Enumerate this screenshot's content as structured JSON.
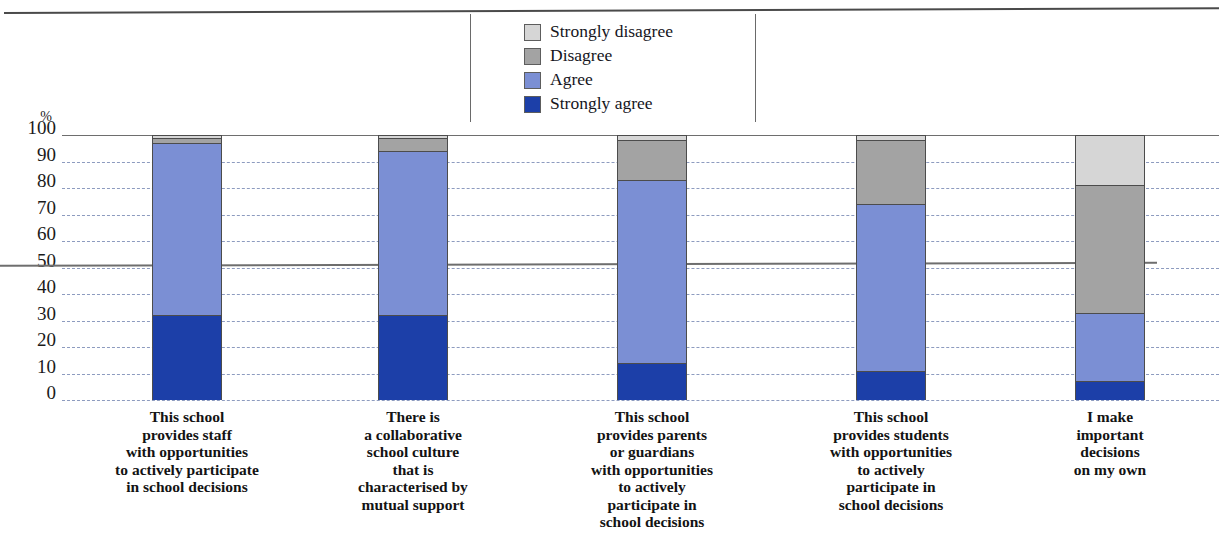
{
  "chart_data": {
    "type": "bar",
    "subtype": "stacked-column-100",
    "title": "",
    "xlabel": "",
    "ylabel": "%",
    "ylim": [
      0,
      100
    ],
    "ytick_labels": [
      "100",
      "90",
      "80",
      "70",
      "60",
      "50",
      "40",
      "30",
      "20",
      "10",
      "0"
    ],
    "ytick_values": [
      100,
      90,
      80,
      70,
      60,
      50,
      40,
      30,
      20,
      10,
      0
    ],
    "grid": true,
    "legend_position": "top-center",
    "categories": [
      "This school provides staff with opportunities to actively participate in school decisions",
      "There is a collaborative school culture that is characterised by mutual support",
      "This school provides parents or guardians with opportunities to actively participate in school decisions",
      "This school provides students with opportunities to actively participate in school decisions",
      "I make important decisions on my own"
    ],
    "category_lines": [
      [
        "This school",
        "provides staff",
        "with opportunities",
        "to actively participate",
        "in school decisions"
      ],
      [
        "There is",
        "a collaborative",
        "school culture",
        "that is",
        "characterised by",
        "mutual support"
      ],
      [
        "This school",
        "provides parents",
        "or guardians",
        "with opportunities",
        "to actively",
        "participate in",
        "school decisions"
      ],
      [
        "This school",
        "provides students",
        "with opportunities",
        "to actively",
        "participate in",
        "school decisions"
      ],
      [
        "I make",
        "important",
        "decisions",
        "on my own"
      ]
    ],
    "series": [
      {
        "name": "Strongly agree",
        "color": "#1c3fa8",
        "values": [
          32,
          32,
          14,
          11,
          7
        ]
      },
      {
        "name": "Agree",
        "color": "#7b8fd4",
        "values": [
          65,
          62,
          69,
          63,
          26
        ]
      },
      {
        "name": "Disagree",
        "color": "#a3a3a3",
        "values": [
          2,
          5,
          15,
          24,
          48
        ]
      },
      {
        "name": "Strongly disagree",
        "color": "#d6d6d6",
        "values": [
          1,
          1,
          2,
          2,
          19
        ]
      }
    ],
    "legend": [
      {
        "label": "Strongly disagree",
        "color": "#d6d6d6"
      },
      {
        "label": "Disagree",
        "color": "#a3a3a3"
      },
      {
        "label": "Agree",
        "color": "#7b8fd4"
      },
      {
        "label": "Strongly agree",
        "color": "#1c3fa8"
      }
    ]
  }
}
